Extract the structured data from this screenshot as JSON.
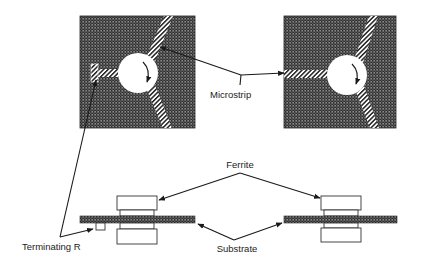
{
  "diagram": {
    "labels": {
      "microstrip": "Microstrip",
      "ferrite": "Ferrite",
      "substrate": "Substrate",
      "terminating_r": "Terminating R"
    },
    "top_views": [
      {
        "name": "isolator-top-view",
        "has_terminating_resistor": true,
        "rotation": "clockwise"
      },
      {
        "name": "circulator-top-view",
        "has_terminating_resistor": false,
        "rotation": "clockwise"
      }
    ],
    "side_views": [
      {
        "name": "isolator-side-view",
        "has_terminating_resistor": true
      },
      {
        "name": "circulator-side-view",
        "has_terminating_resistor": false
      }
    ],
    "colors": {
      "substrate_fill": "#4a4a4a",
      "strip_fill": "#ffffff",
      "line": "#1a1a1a",
      "background": "#ffffff"
    }
  }
}
